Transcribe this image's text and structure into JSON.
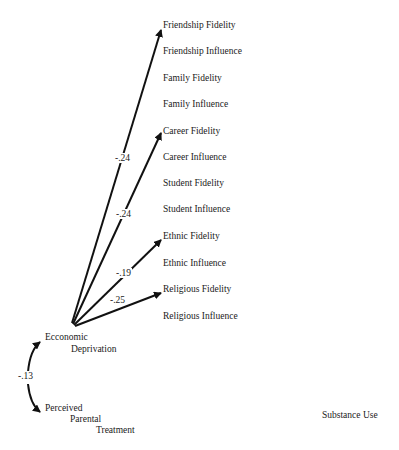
{
  "diagram": {
    "source": "Economic Deprivation",
    "source_lines": [
      "Ecconomic",
      "Deprivation"
    ],
    "covariate_lines": [
      "Perceived",
      "Parental",
      "Treatment"
    ],
    "outcome": "Substance Use",
    "targets": [
      "Friendship Fidelity",
      "Friendship Influence",
      "Family Fidelity",
      "Family Influence",
      "Career Fidelity",
      "Career Influence",
      "Student Fidelity",
      "Student Influence",
      "Ethnic Fidelity",
      "Ethnic Influence",
      "Religious Fidelity",
      "Religious Influence"
    ],
    "paths": [
      {
        "from": "Ecconomic Deprivation",
        "to": "Friendship Fidelity",
        "coef": "-.24"
      },
      {
        "from": "Ecconomic Deprivation",
        "to": "Career Fidelity",
        "coef": "-.24"
      },
      {
        "from": "Ecconomic Deprivation",
        "to": "Ethnic Fidelity",
        "coef": "-.19"
      },
      {
        "from": "Ecconomic Deprivation",
        "to": "Religious Fidelity",
        "coef": "-.25"
      }
    ],
    "correlation": {
      "between": [
        "Ecconomic Deprivation",
        "Perceived Parental Treatment"
      ],
      "coef": "-.13"
    }
  }
}
